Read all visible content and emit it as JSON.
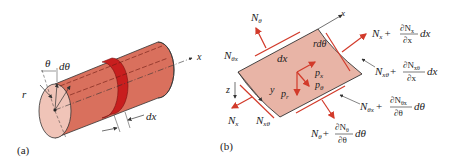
{
  "colors": {
    "cylinder_body": "#d9705d",
    "cylinder_end": "#f0c4b8",
    "ring": "#c81e1e",
    "element_fill": "#e8b4a6",
    "force_arrow": "#d23a2a",
    "line": "#333333"
  },
  "panel_a": {
    "caption": "(a)",
    "labels": {
      "theta": "θ",
      "d_theta": "dθ",
      "r": "r",
      "dx": "dx",
      "x_axis": "x"
    }
  },
  "panel_b": {
    "caption": "(b)",
    "axes": {
      "x": "x",
      "y": "y",
      "z": "z"
    },
    "element_labels": {
      "dx": "dx",
      "r_dtheta": "rdθ"
    },
    "loads": {
      "px": "p",
      "px_sub": "x",
      "ptheta": "p",
      "ptheta_sub": "θ",
      "pr": "p",
      "pr_sub": "r"
    },
    "forces": {
      "N_theta": {
        "main": "N",
        "sub": "θ"
      },
      "N_theta_x": {
        "main": "N",
        "sub": "θx"
      },
      "N_x": {
        "main": "N",
        "sub": "x"
      },
      "N_x_theta": {
        "main": "N",
        "sub": "xθ"
      },
      "N_x_plus": {
        "base": "N",
        "base_sub": "x",
        "plus": "+",
        "num": "∂N",
        "num_sub": "x",
        "den": "∂x",
        "diff": "dx"
      },
      "N_x_theta_plus": {
        "base": "N",
        "base_sub": "xθ",
        "plus": "+",
        "num": "∂N",
        "num_sub": "xθ",
        "den": "∂x",
        "diff": "dx"
      },
      "N_theta_x_plus": {
        "base": "N",
        "base_sub": "θx",
        "plus": "+",
        "num": "∂N",
        "num_sub": "θx",
        "den": "∂θ",
        "diff": "dθ"
      },
      "N_theta_plus": {
        "base": "N",
        "base_sub": "θ",
        "plus": "+",
        "num": "∂N",
        "num_sub": "θ",
        "den": "∂θ",
        "diff": "dθ"
      }
    }
  }
}
